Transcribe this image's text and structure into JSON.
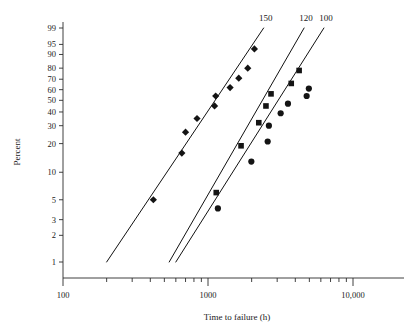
{
  "chart_data": {
    "type": "scatter",
    "title": "",
    "subtitle": "",
    "xlabel": "Time to failure (h)",
    "ylabel": "Percent",
    "xscale": "log",
    "yscale": "weibull-probability",
    "xlim": [
      100,
      10000
    ],
    "ylim": [
      1,
      99
    ],
    "grid": false,
    "legend_position": "top-inline-at-line-ends",
    "x_tick_labels": [
      "100",
      "1000",
      "10,000"
    ],
    "x_tick_values": [
      100,
      1000,
      10000
    ],
    "x_minor_tick_values": [
      200,
      300,
      400,
      500,
      600,
      700,
      800,
      900,
      2000,
      3000,
      4000,
      5000,
      6000,
      7000,
      8000,
      9000
    ],
    "y_tick_labels": [
      "99",
      "95",
      "90",
      "80",
      "70",
      "60",
      "50",
      "40",
      "30",
      "20",
      "10",
      "5",
      "3",
      "2",
      "1"
    ],
    "y_tick_values": [
      99,
      95,
      90,
      80,
      70,
      60,
      50,
      40,
      30,
      20,
      10,
      5,
      3,
      2,
      1
    ],
    "series": [
      {
        "name": "150",
        "label": "150",
        "marker": "diamond",
        "color": "#141414",
        "points": [
          {
            "x": 420,
            "y": 5
          },
          {
            "x": 660,
            "y": 16
          },
          {
            "x": 700,
            "y": 26
          },
          {
            "x": 840,
            "y": 35
          },
          {
            "x": 1110,
            "y": 45
          },
          {
            "x": 1130,
            "y": 54
          },
          {
            "x": 1420,
            "y": 62
          },
          {
            "x": 1630,
            "y": 71
          },
          {
            "x": 1880,
            "y": 80
          },
          {
            "x": 2090,
            "y": 93
          }
        ],
        "fit_line": {
          "x1": 200,
          "y1": 1,
          "x2": 2420,
          "y2": 99
        }
      },
      {
        "name": "120",
        "label": "120",
        "marker": "square",
        "color": "#141414",
        "points": [
          {
            "x": 1140,
            "y": 6
          },
          {
            "x": 1690,
            "y": 19
          },
          {
            "x": 2240,
            "y": 32
          },
          {
            "x": 2510,
            "y": 45
          },
          {
            "x": 2720,
            "y": 56
          },
          {
            "x": 3750,
            "y": 66
          },
          {
            "x": 4250,
            "y": 78
          }
        ],
        "fit_line": {
          "x1": 540,
          "y1": 1,
          "x2": 4600,
          "y2": 99
        }
      },
      {
        "name": "100",
        "label": "100",
        "marker": "circle",
        "color": "#141414",
        "points": [
          {
            "x": 1170,
            "y": 4
          },
          {
            "x": 1990,
            "y": 13
          },
          {
            "x": 2580,
            "y": 21
          },
          {
            "x": 2630,
            "y": 30
          },
          {
            "x": 3170,
            "y": 39
          },
          {
            "x": 3560,
            "y": 47
          },
          {
            "x": 4790,
            "y": 54
          },
          {
            "x": 4960,
            "y": 61
          }
        ],
        "fit_line": {
          "x1": 600,
          "y1": 1,
          "x2": 6300,
          "y2": 99
        }
      }
    ]
  },
  "axes": {
    "x_title": "Time to failure (h)",
    "y_title": "Percent"
  }
}
